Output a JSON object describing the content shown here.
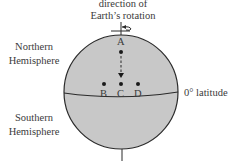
{
  "diagram": {
    "rotation_label_line1": "direction of",
    "rotation_label_line2": "Earth’s rotation",
    "northern_label_line1": "Northern",
    "northern_label_line2": "Hemisphere",
    "southern_label_line1": "Southern",
    "southern_label_line2": "Hemisphere",
    "equator_label": "0° latitude",
    "points": [
      {
        "label": "A"
      },
      {
        "label": "B"
      },
      {
        "label": "C"
      },
      {
        "label": "D"
      }
    ],
    "colors": {
      "globe_fill": "#c8c8c8",
      "stroke": "#2a2a2a",
      "text": "#3a3a3a"
    }
  }
}
